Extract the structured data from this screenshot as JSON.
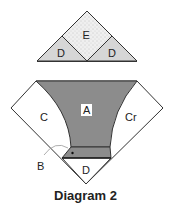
{
  "diagram": {
    "caption": "Diagram 2",
    "top_unit": {
      "pieces": [
        {
          "id": "E",
          "label": "E",
          "fill": "#ededed",
          "pattern": "stippled"
        },
        {
          "id": "D_left",
          "label": "D",
          "fill": "#d6d6d6"
        },
        {
          "id": "D_right",
          "label": "D",
          "fill": "#d6d6d6"
        }
      ]
    },
    "bottom_unit": {
      "pieces": [
        {
          "id": "A",
          "label": "A",
          "fill": "#8c8c8c"
        },
        {
          "id": "C",
          "label": "C",
          "fill": "#ffffff"
        },
        {
          "id": "Cr",
          "label": "Cr",
          "fill": "#ffffff"
        },
        {
          "id": "B",
          "label": "B",
          "fill": "#8c8c8c"
        },
        {
          "id": "D",
          "label": "D",
          "fill": "#ffffff"
        }
      ]
    },
    "colors": {
      "stroke": "#333333",
      "dark_fill": "#8c8c8c",
      "light_fill": "#d6d6d6"
    }
  }
}
